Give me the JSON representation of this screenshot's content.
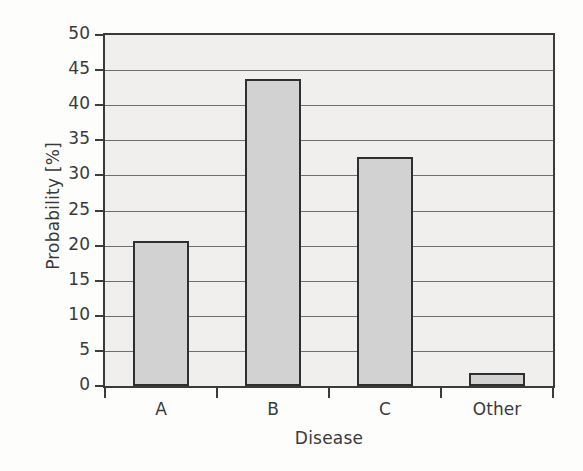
{
  "chart_data": {
    "type": "bar",
    "title": "",
    "xlabel": "Disease",
    "ylabel": "Probability [%]",
    "categories": [
      "A",
      "B",
      "C",
      "Other"
    ],
    "values": [
      20.7,
      43.7,
      32.6,
      1.8
    ],
    "ylim": [
      0,
      50
    ],
    "yticks": [
      0,
      5,
      10,
      15,
      20,
      25,
      30,
      35,
      40,
      45,
      50
    ],
    "ytick_labels": [
      "0",
      "5",
      "10",
      "15",
      "20",
      "25",
      "30",
      "35",
      "40",
      "45",
      "50"
    ],
    "grid": true,
    "grid_axis": "y",
    "legend": false,
    "legend_position": "none",
    "bar_fill_color": "#d2d2d2",
    "bar_edge_color": "#2f2f2f",
    "plot_background_color": "#f0efed",
    "axis_color": "#3b3b3b",
    "text_color": "#3a3a3a"
  }
}
